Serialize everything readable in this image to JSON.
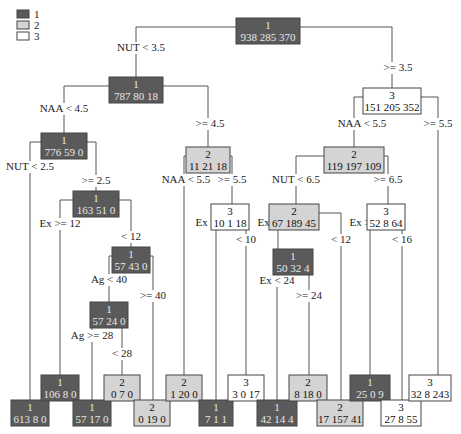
{
  "legend": {
    "items": [
      {
        "label": "1",
        "color": "#5a5a5a"
      },
      {
        "label": "2",
        "color": "#d4d4d4"
      },
      {
        "label": "3",
        "color": "#ffffff"
      }
    ]
  },
  "colors": {
    "class1": "#5a5a5a",
    "class2": "#d4d4d4",
    "class3": "#ffffff"
  },
  "nodes": [
    {
      "id": "root",
      "cls": "1",
      "counts": "938 285 370",
      "x": 268,
      "y": 31,
      "w": 64
    },
    {
      "id": "n_787",
      "cls": "1",
      "counts": "787 80 18",
      "x": 136,
      "y": 90,
      "w": 54
    },
    {
      "id": "n_151",
      "cls": "3",
      "counts": "151 205 352",
      "x": 392,
      "y": 101,
      "w": 58
    },
    {
      "id": "n_776",
      "cls": "1",
      "counts": "776 59 0",
      "x": 64,
      "y": 146,
      "w": 46
    },
    {
      "id": "n_11",
      "cls": "2",
      "counts": "11 21 18",
      "x": 208,
      "y": 160,
      "w": 44
    },
    {
      "id": "n_119",
      "cls": "2",
      "counts": "119 197 109",
      "x": 354,
      "y": 160,
      "w": 60
    },
    {
      "id": "n_163",
      "cls": "1",
      "counts": "163 51 0",
      "x": 96,
      "y": 204,
      "w": 46
    },
    {
      "id": "n_10",
      "cls": "3",
      "counts": "10 1 18",
      "x": 230,
      "y": 217,
      "w": 38
    },
    {
      "id": "n_67",
      "cls": "2",
      "counts": "67 189 45",
      "x": 294,
      "y": 217,
      "w": 50
    },
    {
      "id": "n_52",
      "cls": "3",
      "counts": "52 8 64",
      "x": 386,
      "y": 217,
      "w": 38
    },
    {
      "id": "n_57a",
      "cls": "1",
      "counts": "57 43 0",
      "x": 131,
      "y": 260,
      "w": 38
    },
    {
      "id": "n_50",
      "cls": "1",
      "counts": "50 32 4",
      "x": 293,
      "y": 262,
      "w": 40
    },
    {
      "id": "n_57b",
      "cls": "1",
      "counts": "57 24 0",
      "x": 109,
      "y": 315,
      "w": 38
    },
    {
      "id": "leaf_613",
      "cls": "1",
      "counts": "613 8 0",
      "x": 30,
      "y": 413,
      "w": 38
    },
    {
      "id": "leaf_106",
      "cls": "1",
      "counts": "106 8 0",
      "x": 60,
      "y": 388,
      "w": 38
    },
    {
      "id": "leaf_57",
      "cls": "1",
      "counts": "57 17 0",
      "x": 92,
      "y": 413,
      "w": 38
    },
    {
      "id": "leaf_070",
      "cls": "2",
      "counts": "0 7 0",
      "x": 122,
      "y": 388,
      "w": 36
    },
    {
      "id": "leaf_0190",
      "cls": "2",
      "counts": "0 19 0",
      "x": 152,
      "y": 413,
      "w": 36
    },
    {
      "id": "leaf_1200",
      "cls": "2",
      "counts": "1 20 0",
      "x": 184,
      "y": 388,
      "w": 36
    },
    {
      "id": "leaf_711",
      "cls": "1",
      "counts": "7 1 1",
      "x": 216,
      "y": 413,
      "w": 34
    },
    {
      "id": "leaf_3017",
      "cls": "3",
      "counts": "3 0 17",
      "x": 246,
      "y": 388,
      "w": 36
    },
    {
      "id": "leaf_42",
      "cls": "1",
      "counts": "42 14 4",
      "x": 277,
      "y": 413,
      "w": 40
    },
    {
      "id": "leaf_8180",
      "cls": "2",
      "counts": "8 18 0",
      "x": 308,
      "y": 388,
      "w": 38
    },
    {
      "id": "leaf_17",
      "cls": "2",
      "counts": "17 157 41",
      "x": 340,
      "y": 413,
      "w": 46
    },
    {
      "id": "leaf_25",
      "cls": "1",
      "counts": "25 0 9",
      "x": 370,
      "y": 388,
      "w": 40
    },
    {
      "id": "leaf_27",
      "cls": "3",
      "counts": "27 8 55",
      "x": 401,
      "y": 413,
      "w": 40
    },
    {
      "id": "leaf_32",
      "cls": "3",
      "counts": "32 8 243",
      "x": 430,
      "y": 388,
      "w": 42
    }
  ],
  "splits": [
    {
      "text": "NUT < 3.5",
      "x": 141,
      "y": 51
    },
    {
      "text": ">= 3.5",
      "x": 398,
      "y": 71
    },
    {
      "text": "NAA < 4.5",
      "x": 64,
      "y": 112
    },
    {
      "text": ">= 4.5",
      "x": 210,
      "y": 127
    },
    {
      "text": "NAA < 5.5",
      "x": 362,
      "y": 127
    },
    {
      "text": ">= 5.5",
      "x": 438,
      "y": 127
    },
    {
      "text": "NUT < 2.5",
      "x": 30,
      "y": 170
    },
    {
      "text": ">= 2.5",
      "x": 96,
      "y": 184
    },
    {
      "text": "NAA < 5.5",
      "x": 186,
      "y": 183
    },
    {
      "text": ">= 5.5",
      "x": 232,
      "y": 183
    },
    {
      "text": "NUT < 6.5",
      "x": 296,
      "y": 183
    },
    {
      "text": ">= 6.5",
      "x": 388,
      "y": 183
    },
    {
      "text": "Ex >= 12",
      "x": 60,
      "y": 227
    },
    {
      "text": "< 12",
      "x": 131,
      "y": 240
    },
    {
      "text": "Ex >= 10",
      "x": 216,
      "y": 226
    },
    {
      "text": "< 10",
      "x": 246,
      "y": 243
    },
    {
      "text": "Ex >= 12",
      "x": 278,
      "y": 226
    },
    {
      "text": "< 12",
      "x": 341,
      "y": 243
    },
    {
      "text": "Ex >= 16",
      "x": 370,
      "y": 226
    },
    {
      "text": "< 16",
      "x": 402,
      "y": 243
    },
    {
      "text": "Ag < 40",
      "x": 109,
      "y": 283
    },
    {
      "text": ">= 40",
      "x": 153,
      "y": 299
    },
    {
      "text": "Ex < 24",
      "x": 277,
      "y": 284
    },
    {
      "text": ">= 24",
      "x": 309,
      "y": 299
    },
    {
      "text": "Ag >= 28",
      "x": 92,
      "y": 339
    },
    {
      "text": "< 28",
      "x": 122,
      "y": 357
    }
  ]
}
